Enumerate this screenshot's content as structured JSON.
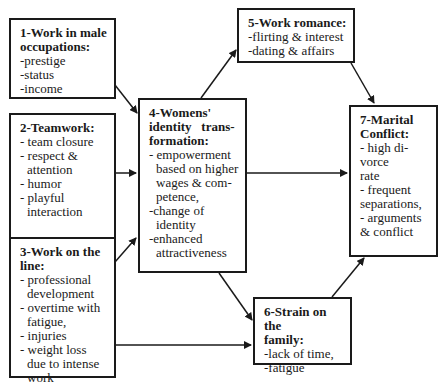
{
  "boxes": {
    "b1": {
      "title_line1": "1-Work in male",
      "title_line2": "occupations:",
      "items": [
        "-prestige",
        "-status",
        "-income"
      ]
    },
    "b2": {
      "title": "2-Teamwork:",
      "items": [
        "- team closure",
        "- respect & attention",
        "- humor",
        "- playful interaction"
      ]
    },
    "b3": {
      "title_line1": "3-Work on the",
      "title_line2": "line:",
      "items": [
        "- professional development",
        "- overtime with fatigue,",
        "- injuries",
        "- weight loss due to intense work"
      ]
    },
    "b4": {
      "title_line1": "4-Womens'",
      "title_line2": "identity   trans-",
      "title_line3": "formation:",
      "items": [
        "- empowerment based on higher wages & com-petence,",
        "-change of identity",
        "-enhanced attractiveness"
      ]
    },
    "b5": {
      "title": "5-Work romance:",
      "items": [
        "-flirting & interest",
        "-dating & affairs"
      ]
    },
    "b6": {
      "title_line1": "6-Strain on the",
      "title_line2": "family:",
      "items": [
        "-lack of time,",
        "-fatigue"
      ]
    },
    "b7": {
      "title_line1": "7-Marital",
      "title_line2": "Conflict:",
      "items": [
        "- high di-",
        "vorce",
        "rate",
        "- frequent",
        "separations,",
        "- arguments",
        "& conflict"
      ]
    }
  },
  "edges": [
    {
      "from": "1",
      "to": "4"
    },
    {
      "from": "2",
      "to": "4"
    },
    {
      "from": "3",
      "to": "4"
    },
    {
      "from": "3",
      "to": "6"
    },
    {
      "from": "4",
      "to": "5"
    },
    {
      "from": "4",
      "to": "7"
    },
    {
      "from": "4",
      "to": "6"
    },
    {
      "from": "5",
      "to": "7"
    },
    {
      "from": "6",
      "to": "7"
    }
  ],
  "colors": {
    "line": "#1a1a1a",
    "background": "#ffffff"
  }
}
